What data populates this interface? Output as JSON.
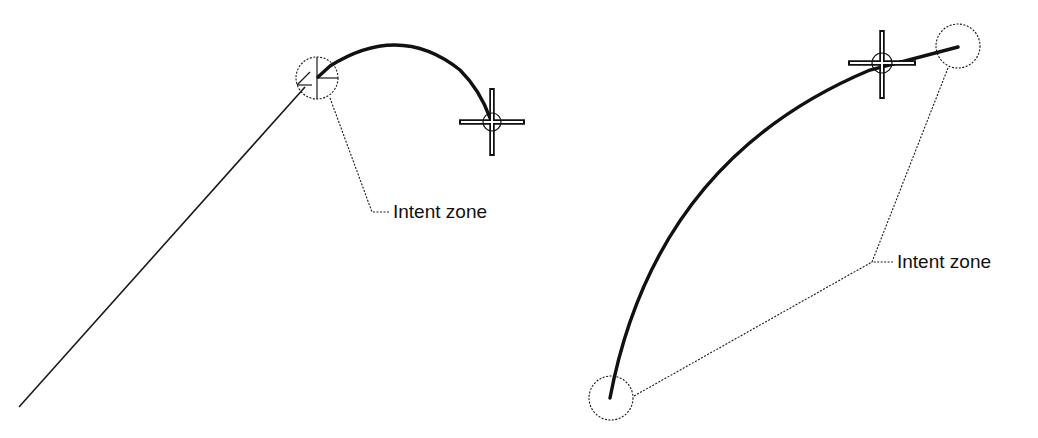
{
  "diagram": {
    "left": {
      "label": "Intent zone",
      "line_start": [
        19,
        407
      ],
      "line_end": [
        305,
        87
      ],
      "intent_circle": {
        "cx": 317,
        "cy": 78,
        "r": 21
      },
      "arc": {
        "start": [
          328,
          66
        ],
        "control": [
          400,
          10
        ],
        "end": [
          490,
          118
        ]
      },
      "crosshair": {
        "cx": 492,
        "cy": 122
      }
    },
    "right": {
      "label": "Intent zone",
      "start_circle": {
        "cx": 611,
        "cy": 398,
        "r": 22
      },
      "end_circle": {
        "cx": 958,
        "cy": 46,
        "r": 22
      },
      "arc": {
        "start": [
          610,
          398
        ],
        "control": [
          655,
          160
        ],
        "end": [
          870,
          70
        ]
      },
      "tail": {
        "start": [
          870,
          70
        ],
        "end": [
          958,
          47
        ]
      },
      "crosshair": {
        "cx": 882,
        "cy": 63
      }
    },
    "colors": {
      "ink": "#111111",
      "background": "#ffffff"
    }
  }
}
